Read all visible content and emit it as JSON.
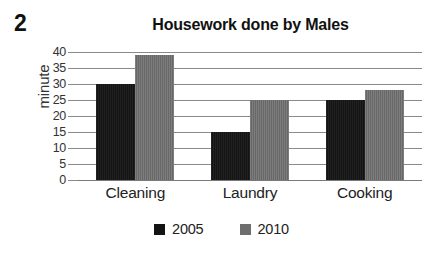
{
  "question_number": "2",
  "chart_data": {
    "type": "bar",
    "title": "Housework done by Males",
    "xlabel": "",
    "ylabel": "minute",
    "ylim": [
      0,
      40
    ],
    "ytick_step": 5,
    "yticks": [
      "0",
      "5",
      "10",
      "15",
      "20",
      "25",
      "30",
      "35",
      "40"
    ],
    "grid": true,
    "legend_position": "bottom-center",
    "categories": [
      "Cleaning",
      "Laundry",
      "Cooking"
    ],
    "series": [
      {
        "name": "2005",
        "color": "#141414",
        "values": [
          30,
          15,
          25
        ]
      },
      {
        "name": "2010",
        "color": "#6e6e6e",
        "values": [
          39,
          25,
          28
        ]
      }
    ]
  }
}
